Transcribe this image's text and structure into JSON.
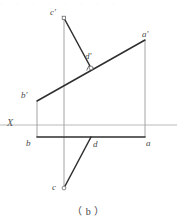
{
  "figure": {
    "caption": "（ b ）",
    "axis_label": "X",
    "top_edge_artifact": "· ·  · ·   · ·    · ·",
    "colors": {
      "object_line": "#333333",
      "projection_line": "#8a8a8a",
      "axis_line": "#b9b9b9",
      "label_text": "#4a4a4a",
      "background": "#ffffff"
    },
    "points": [
      {
        "name": "c-prime",
        "label": "c'",
        "x": 64,
        "y": 18,
        "marker": true,
        "label_x": 50,
        "label_y": 9
      },
      {
        "name": "a-prime",
        "label": "a'",
        "x": 145,
        "y": 40,
        "marker": false,
        "label_x": 143,
        "label_y": 31
      },
      {
        "name": "d-prime",
        "label": "d'",
        "x": 91,
        "y": 68,
        "marker": true,
        "label_x": 86,
        "label_y": 53
      },
      {
        "name": "b-prime",
        "label": "b'",
        "x": 37,
        "y": 101,
        "marker": false,
        "label_x": 22,
        "label_y": 92
      },
      {
        "name": "b",
        "label": "b",
        "x": 37,
        "y": 137,
        "marker": false,
        "label_x": 26,
        "label_y": 139
      },
      {
        "name": "d",
        "label": "d",
        "x": 91,
        "y": 137,
        "marker": false,
        "label_x": 93,
        "label_y": 140
      },
      {
        "name": "a",
        "label": "a",
        "x": 145,
        "y": 137,
        "marker": false,
        "label_x": 146,
        "label_y": 139
      },
      {
        "name": "c",
        "label": "c",
        "x": 64,
        "y": 188,
        "marker": true,
        "label_x": 53,
        "label_y": 184
      }
    ],
    "axis": {
      "label": "X",
      "label_x": 8,
      "label_y": 119,
      "y": 125,
      "x_start": 0,
      "x_end": 177
    },
    "object_lines": [
      {
        "name": "front-view-line-ba",
        "x1": 37,
        "y1": 101,
        "x2": 145,
        "y2": 40
      },
      {
        "name": "front-view-line-cd",
        "x1": 64,
        "y1": 18,
        "x2": 91,
        "y2": 68
      },
      {
        "name": "top-view-line-ba",
        "x1": 37,
        "y1": 137,
        "x2": 145,
        "y2": 137
      },
      {
        "name": "top-view-line-dc",
        "x1": 91,
        "y1": 137,
        "x2": 64,
        "y2": 188
      }
    ],
    "projection_lines": [
      {
        "name": "projector-b",
        "x1": 37,
        "y1": 101,
        "x2": 37,
        "y2": 137
      },
      {
        "name": "projector-a",
        "x1": 145,
        "y1": 40,
        "x2": 145,
        "y2": 137
      },
      {
        "name": "projector-c",
        "x1": 64,
        "y1": 18,
        "x2": 64,
        "y2": 188
      }
    ],
    "right_angle_marker": {
      "name": "right-angle-at-d-prime",
      "x": 91,
      "y": 68,
      "size": 5
    }
  }
}
